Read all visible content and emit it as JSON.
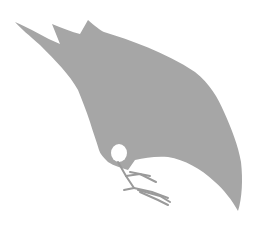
{
  "image": {
    "subject": "bird silhouette",
    "description": "Gray silhouette of a crow bending down to peck",
    "colors": {
      "background": "#ffffff",
      "silhouette": "#a6a6a6",
      "legs": "#9a9a9a"
    }
  }
}
